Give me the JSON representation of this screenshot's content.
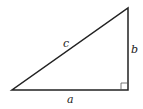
{
  "diagram": {
    "type": "right-triangle",
    "labels": {
      "hypotenuse": "c",
      "vertical_leg": "b",
      "horizontal_leg": "a"
    },
    "vertices": {
      "bottom_left": [
        12,
        90
      ],
      "bottom_right": [
        128,
        90
      ],
      "top_right": [
        128,
        8
      ]
    },
    "right_angle_marker": "bottom_right",
    "colors": {
      "stroke": "#222222",
      "marker": "#555555"
    }
  }
}
